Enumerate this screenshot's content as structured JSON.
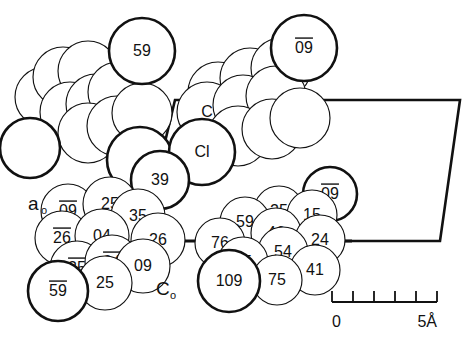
{
  "figure": {
    "background_color": "#ffffff",
    "line_color": "#111111",
    "fill_color": "#ffffff"
  },
  "axes": {
    "a_label": "a",
    "a_sub": "o",
    "c_label": "C",
    "c_sub": "o"
  },
  "scalebar": {
    "start_label": "0",
    "end_label": "5Å",
    "tick_count": 6,
    "unit": "Å",
    "range_value": 5
  },
  "atoms": [
    {
      "id": "a1",
      "label": "",
      "bar": false,
      "cx": 45,
      "cy": 97,
      "r": 30,
      "w": "thin",
      "z": 1
    },
    {
      "id": "a2",
      "label": "",
      "bar": false,
      "cx": 63,
      "cy": 77,
      "r": 30,
      "w": "thin",
      "z": 2
    },
    {
      "id": "a3",
      "label": "",
      "bar": false,
      "cx": 88,
      "cy": 71,
      "r": 30,
      "w": "thin",
      "z": 3
    },
    {
      "id": "a4",
      "label": "",
      "bar": false,
      "cx": 70,
      "cy": 112,
      "r": 30,
      "w": "thin",
      "z": 4
    },
    {
      "id": "a5",
      "label": "",
      "bar": false,
      "cx": 96,
      "cy": 104,
      "r": 30,
      "w": "thin",
      "z": 5
    },
    {
      "id": "a6",
      "label": "",
      "bar": false,
      "cx": 118,
      "cy": 92,
      "r": 30,
      "w": "thin",
      "z": 6
    },
    {
      "id": "a7",
      "label": "",
      "bar": false,
      "cx": 88,
      "cy": 133,
      "r": 30,
      "w": "thin",
      "z": 7
    },
    {
      "id": "a8",
      "label": "",
      "bar": false,
      "cx": 117,
      "cy": 126,
      "r": 30,
      "w": "thin",
      "z": 8
    },
    {
      "id": "a9",
      "label": "",
      "bar": false,
      "cx": 142,
      "cy": 113,
      "r": 30,
      "w": "thin",
      "z": 9
    },
    {
      "id": "a10",
      "label": "59",
      "bar": false,
      "cx": 142,
      "cy": 51,
      "r": 33,
      "w": "thick",
      "z": 11
    },
    {
      "id": "b1",
      "label": "",
      "bar": false,
      "cx": 218,
      "cy": 92,
      "r": 30,
      "w": "thin",
      "z": 20
    },
    {
      "id": "b2",
      "label": "",
      "bar": false,
      "cx": 250,
      "cy": 78,
      "r": 30,
      "w": "thin",
      "z": 21
    },
    {
      "id": "b3",
      "label": "",
      "bar": false,
      "cx": 281,
      "cy": 68,
      "r": 30,
      "w": "thin",
      "z": 22
    },
    {
      "id": "b4",
      "label": "C",
      "bar": false,
      "cx": 207,
      "cy": 112,
      "r": 30,
      "w": "thin",
      "z": 23
    },
    {
      "id": "b5",
      "label": "",
      "bar": false,
      "cx": 243,
      "cy": 105,
      "r": 30,
      "w": "thin",
      "z": 24
    },
    {
      "id": "b6",
      "label": "",
      "bar": false,
      "cx": 276,
      "cy": 96,
      "r": 30,
      "w": "thin",
      "z": 25
    },
    {
      "id": "b7",
      "label": "",
      "bar": false,
      "cx": 238,
      "cy": 136,
      "r": 30,
      "w": "thin",
      "z": 26
    },
    {
      "id": "b8",
      "label": "",
      "bar": false,
      "cx": 272,
      "cy": 129,
      "r": 30,
      "w": "thin",
      "z": 27
    },
    {
      "id": "b9",
      "label": "",
      "bar": false,
      "cx": 300,
      "cy": 118,
      "r": 30,
      "w": "thin",
      "z": 28
    },
    {
      "id": "b10",
      "label": "09",
      "bar": true,
      "cx": 304,
      "cy": 48,
      "r": 33,
      "w": "thick",
      "z": 30
    },
    {
      "id": "b11",
      "label": "Cl",
      "bar": false,
      "cx": 202,
      "cy": 152,
      "r": 33,
      "w": "thick",
      "z": 31
    },
    {
      "id": "b12",
      "label": "",
      "bar": false,
      "cx": 140,
      "cy": 160,
      "r": 33,
      "w": "thick",
      "z": 29
    },
    {
      "id": "b13",
      "label": "",
      "bar": false,
      "cx": 30,
      "cy": 148,
      "r": 30,
      "w": "thick",
      "z": 10
    },
    {
      "id": "c1",
      "label": "09",
      "bar": true,
      "cx": 68,
      "cy": 211,
      "r": 27,
      "w": "thin",
      "z": 41
    },
    {
      "id": "c2",
      "label": "25",
      "bar": false,
      "cx": 110,
      "cy": 204,
      "r": 27,
      "w": "thin",
      "z": 42
    },
    {
      "id": "c3",
      "label": "35",
      "bar": false,
      "cx": 138,
      "cy": 216,
      "r": 27,
      "w": "thin",
      "z": 43
    },
    {
      "id": "c4",
      "label": "26",
      "bar": true,
      "cx": 62,
      "cy": 238,
      "r": 27,
      "w": "thin",
      "z": 44
    },
    {
      "id": "c5",
      "label": "04",
      "bar": false,
      "cx": 102,
      "cy": 236,
      "r": 27,
      "w": "thin",
      "z": 45
    },
    {
      "id": "c6",
      "label": "26",
      "bar": false,
      "cx": 158,
      "cy": 240,
      "r": 27,
      "w": "thin",
      "z": 46
    },
    {
      "id": "c7",
      "label": "35",
      "bar": true,
      "cx": 77,
      "cy": 268,
      "r": 27,
      "w": "thin",
      "z": 47
    },
    {
      "id": "c8",
      "label": "04",
      "bar": true,
      "cx": 112,
      "cy": 262,
      "r": 27,
      "w": "thin",
      "z": 48
    },
    {
      "id": "c9",
      "label": "09",
      "bar": false,
      "cx": 143,
      "cy": 266,
      "r": 27,
      "w": "thin",
      "z": 49
    },
    {
      "id": "c10",
      "label": "25",
      "bar": false,
      "cx": 105,
      "cy": 283,
      "r": 27,
      "w": "thin",
      "z": 50
    },
    {
      "id": "c11",
      "label": "59",
      "bar": true,
      "cx": 58,
      "cy": 291,
      "r": 30,
      "w": "thick",
      "z": 51
    },
    {
      "id": "c12",
      "label": "39",
      "bar": false,
      "cx": 160,
      "cy": 180,
      "r": 29,
      "w": "thick",
      "z": 40
    },
    {
      "id": "d1",
      "label": "09",
      "bar": true,
      "cx": 330,
      "cy": 194,
      "r": 27,
      "w": "thick",
      "z": 60
    },
    {
      "id": "d2",
      "label": "25",
      "bar": false,
      "cx": 279,
      "cy": 211,
      "r": 25,
      "w": "thin",
      "z": 61
    },
    {
      "id": "d3",
      "label": "15",
      "bar": false,
      "cx": 312,
      "cy": 215,
      "r": 25,
      "w": "thin",
      "z": 62
    },
    {
      "id": "d4",
      "label": "59",
      "bar": false,
      "cx": 245,
      "cy": 222,
      "r": 25,
      "w": "thin",
      "z": 63
    },
    {
      "id": "d5",
      "label": "46",
      "bar": false,
      "cx": 276,
      "cy": 233,
      "r": 25,
      "w": "thin",
      "z": 64
    },
    {
      "id": "d6",
      "label": "24",
      "bar": false,
      "cx": 320,
      "cy": 240,
      "r": 25,
      "w": "thin",
      "z": 65
    },
    {
      "id": "d7",
      "label": "76",
      "bar": false,
      "cx": 220,
      "cy": 243,
      "r": 25,
      "w": "thin",
      "z": 66
    },
    {
      "id": "d8",
      "label": "54",
      "bar": false,
      "cx": 283,
      "cy": 252,
      "r": 25,
      "w": "thin",
      "z": 67
    },
    {
      "id": "d9",
      "label": "85",
      "bar": false,
      "cx": 243,
      "cy": 262,
      "r": 25,
      "w": "thin",
      "z": 68
    },
    {
      "id": "d10",
      "label": "41",
      "bar": false,
      "cx": 315,
      "cy": 270,
      "r": 25,
      "w": "thin",
      "z": 69
    },
    {
      "id": "d11",
      "label": "75",
      "bar": false,
      "cx": 277,
      "cy": 280,
      "r": 25,
      "w": "thin",
      "z": 70
    },
    {
      "id": "d12",
      "label": "109",
      "bar": false,
      "cx": 229,
      "cy": 281,
      "r": 31,
      "w": "thick",
      "z": 71
    }
  ],
  "bonds": [
    {
      "id": "bond-left",
      "x1": 110,
      "y1": 142,
      "x2": 165,
      "y2": 142
    },
    {
      "id": "bond-middle",
      "x1": 168,
      "y1": 241,
      "x2": 205,
      "y2": 241
    },
    {
      "id": "bond-right",
      "x1": 338,
      "y1": 241,
      "x2": 352,
      "y2": 241
    }
  ],
  "cell_outline": {
    "points": "165,142 175,100 352,100 460,100 440,241 352,241"
  }
}
